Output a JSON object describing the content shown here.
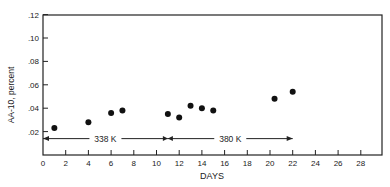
{
  "chart_data": {
    "type": "scatter",
    "title": "",
    "xlabel": "DAYS",
    "ylabel": "AA-10, percent",
    "xlim": [
      0,
      30
    ],
    "ylim": [
      0,
      0.12
    ],
    "xticks": [
      "0",
      "2",
      "4",
      "6",
      "8",
      "10",
      "12",
      "14",
      "16",
      "18",
      "20",
      "22",
      "24",
      "26",
      "28"
    ],
    "yticks": [
      ".02",
      ".04",
      ".06",
      ".08",
      ".10",
      ".12"
    ],
    "grid": false,
    "points": [
      {
        "x": 1,
        "y": 0.023
      },
      {
        "x": 4,
        "y": 0.028
      },
      {
        "x": 6,
        "y": 0.036
      },
      {
        "x": 7,
        "y": 0.038
      },
      {
        "x": 11,
        "y": 0.035
      },
      {
        "x": 12,
        "y": 0.032
      },
      {
        "x": 13,
        "y": 0.042
      },
      {
        "x": 14,
        "y": 0.04
      },
      {
        "x": 15,
        "y": 0.038
      },
      {
        "x": 20.4,
        "y": 0.048
      },
      {
        "x": 22,
        "y": 0.054
      }
    ],
    "annotations": [
      {
        "label": "338 K",
        "x_start": 0,
        "x_end": 11,
        "y": 0.014
      },
      {
        "label": "380 K",
        "x_start": 11,
        "x_end": 22,
        "y": 0.014
      }
    ]
  }
}
